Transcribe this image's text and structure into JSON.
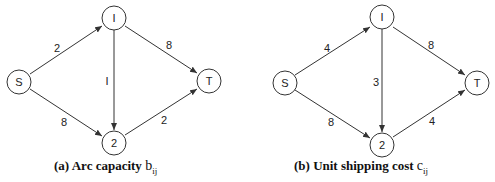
{
  "diagrams": [
    {
      "id": "a",
      "caption_prefix": "(a)",
      "caption_text": "Arc capacity",
      "caption_symbol": "b",
      "caption_subscript": "ij",
      "nodes": {
        "S": "S",
        "1": "I",
        "2": "2",
        "T": "T"
      },
      "edges": {
        "S-1": "2",
        "S-2": "8",
        "1-2": "I",
        "1-T": "8",
        "2-T": "2"
      }
    },
    {
      "id": "b",
      "caption_prefix": "(b)",
      "caption_text": "Unit shipping cost",
      "caption_symbol": "c",
      "caption_subscript": "ij",
      "nodes": {
        "S": "S",
        "1": "I",
        "2": "2",
        "T": "T"
      },
      "edges": {
        "S-1": "4",
        "S-2": "8",
        "1-2": "3",
        "1-T": "8",
        "2-T": "4"
      }
    }
  ]
}
